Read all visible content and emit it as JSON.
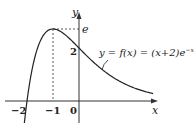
{
  "chart_data": {
    "type": "line",
    "title": "",
    "function": "y = f(x) = (x+2)e^{-x}",
    "xlabel": "x",
    "ylabel": "y",
    "x_ticks": [
      "-2",
      "-1",
      "0"
    ],
    "y_ticks": [
      "2",
      "e"
    ],
    "key_points": [
      {
        "x": -2,
        "y": 0,
        "label": "root"
      },
      {
        "x": -1,
        "y": 2.718,
        "label": "maximum (e)"
      },
      {
        "x": 0,
        "y": 2,
        "label": "y-intercept"
      }
    ],
    "xlim": [
      -2.5,
      3.5
    ],
    "ylim": [
      -0.6,
      3.2
    ]
  },
  "labels": {
    "x_axis": "x",
    "y_axis": "y",
    "tick_neg2": "−2",
    "tick_neg1": "−1",
    "tick_0": "0",
    "tick_y2": "2",
    "tick_e": "e",
    "equation_main": "y = f(x) = (x+2)e",
    "equation_exp": "−x"
  }
}
